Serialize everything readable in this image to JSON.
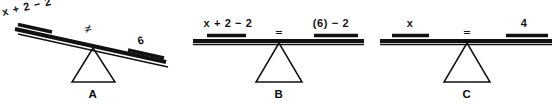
{
  "figure": {
    "background_color": "#ffffff",
    "ink_color": "#111111",
    "panel_count": 3
  },
  "panels": [
    {
      "id": "a",
      "letter": "A",
      "state": "unbalanced",
      "tilt": "right-side-down",
      "left_label": "x + 2 − 2",
      "relation_symbol": "≠",
      "relation_name": "not-equal-sign",
      "right_label": "6"
    },
    {
      "id": "b",
      "letter": "B",
      "state": "balanced",
      "tilt": "level",
      "left_label": "x + 2 − 2",
      "relation_symbol": "=",
      "relation_name": "equals-sign",
      "right_label": "(6) − 2"
    },
    {
      "id": "c",
      "letter": "C",
      "state": "balanced",
      "tilt": "level",
      "left_label": "x",
      "relation_symbol": "=",
      "relation_name": "equals-sign",
      "right_label": "4"
    }
  ]
}
